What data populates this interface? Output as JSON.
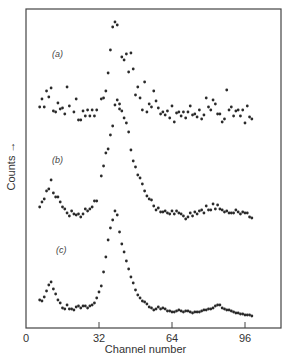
{
  "chart_data": {
    "type": "scatter",
    "title": "",
    "xlabel": "Channel number",
    "ylabel": "Counts →",
    "xlim": [
      0,
      110
    ],
    "xticks": [
      0,
      32,
      64,
      96
    ],
    "grid": false,
    "legend": null,
    "annotations": [
      "(a)",
      "(b)",
      "(c)"
    ],
    "y_units": "arbitrary (vertically offset spectra, y = screen px from top)",
    "series": [
      {
        "name": "(a)",
        "label_pos": [
          52,
          57
        ],
        "points": [
          [
            6,
            107
          ],
          [
            7,
            99
          ],
          [
            8,
            107
          ],
          [
            9,
            91
          ],
          [
            10,
            97
          ],
          [
            11,
            88
          ],
          [
            12,
            111
          ],
          [
            13,
            112
          ],
          [
            14,
            103
          ],
          [
            15,
            109
          ],
          [
            16,
            108
          ],
          [
            17,
            114
          ],
          [
            18,
            87
          ],
          [
            19,
            106
          ],
          [
            21,
            112
          ],
          [
            22,
            99
          ],
          [
            23,
            120
          ],
          [
            24,
            120
          ],
          [
            25,
            111
          ],
          [
            26,
            116
          ],
          [
            27,
            110
          ],
          [
            28,
            116
          ],
          [
            29,
            110
          ],
          [
            30,
            116
          ],
          [
            31,
            110
          ],
          [
            33,
            99
          ],
          [
            34,
            98
          ],
          [
            35,
            91
          ],
          [
            36,
            73
          ],
          [
            37,
            50
          ],
          [
            38,
            27
          ],
          [
            39,
            22
          ],
          [
            40,
            25
          ],
          [
            41,
            109
          ],
          [
            42,
            57
          ],
          [
            43,
            60
          ],
          [
            44,
            54
          ],
          [
            45,
            72
          ],
          [
            46,
            53
          ],
          [
            47,
            69
          ],
          [
            48,
            95
          ],
          [
            49,
            87
          ],
          [
            50,
            98
          ],
          [
            51,
            110
          ],
          [
            52,
            82
          ],
          [
            53,
            112
          ],
          [
            54,
            104
          ],
          [
            55,
            107
          ],
          [
            56,
            91
          ],
          [
            57,
            101
          ],
          [
            58,
            108
          ],
          [
            59,
            114
          ],
          [
            60,
            112
          ],
          [
            61,
            115
          ],
          [
            62,
            111
          ],
          [
            63,
            118
          ],
          [
            64,
            106
          ],
          [
            65,
            122
          ],
          [
            66,
            113
          ],
          [
            67,
            112
          ],
          [
            68,
            116
          ],
          [
            69,
            112
          ],
          [
            70,
            118
          ],
          [
            71,
            112
          ],
          [
            72,
            106
          ],
          [
            73,
            115
          ],
          [
            74,
            114
          ],
          [
            75,
            117
          ],
          [
            76,
            110
          ],
          [
            77,
            119
          ],
          [
            78,
            115
          ],
          [
            79,
            98
          ],
          [
            80,
            107
          ],
          [
            81,
            110
          ],
          [
            82,
            100
          ],
          [
            83,
            104
          ],
          [
            84,
            114
          ],
          [
            85,
            114
          ],
          [
            86,
            122
          ],
          [
            87,
            119
          ],
          [
            88,
            90
          ],
          [
            89,
            110
          ],
          [
            90,
            107
          ],
          [
            91,
            116
          ],
          [
            92,
            111
          ],
          [
            93,
            110
          ],
          [
            94,
            116
          ],
          [
            95,
            110
          ],
          [
            96,
            123
          ],
          [
            97,
            106
          ],
          [
            98,
            117
          ],
          [
            99,
            119
          ]
        ]
      },
      {
        "name": "(b)",
        "label_pos": [
          52,
          163
        ],
        "points": [
          [
            6,
            207
          ],
          [
            7,
            202
          ],
          [
            8,
            199
          ],
          [
            9,
            191
          ],
          [
            10,
            189
          ],
          [
            11,
            180
          ],
          [
            12,
            193
          ],
          [
            13,
            197
          ],
          [
            14,
            197
          ],
          [
            15,
            202
          ],
          [
            16,
            207
          ],
          [
            17,
            209
          ],
          [
            18,
            213
          ],
          [
            19,
            216
          ],
          [
            20,
            211
          ],
          [
            21,
            214
          ],
          [
            22,
            215
          ],
          [
            23,
            214
          ],
          [
            24,
            217
          ],
          [
            25,
            214
          ],
          [
            26,
            209
          ],
          [
            27,
            211
          ],
          [
            28,
            209
          ],
          [
            29,
            207
          ],
          [
            30,
            201
          ],
          [
            31,
            201
          ],
          [
            33,
            176
          ],
          [
            34,
            166
          ],
          [
            35,
            153
          ],
          [
            36,
            149
          ],
          [
            37,
            135
          ],
          [
            38,
            126
          ],
          [
            39,
            105
          ],
          [
            40,
            100
          ],
          [
            41,
            104
          ],
          [
            42,
            111
          ],
          [
            43,
            118
          ],
          [
            44,
            123
          ],
          [
            45,
            132
          ],
          [
            46,
            150
          ],
          [
            47,
            161
          ],
          [
            48,
            167
          ],
          [
            49,
            175
          ],
          [
            50,
            178
          ],
          [
            51,
            184
          ],
          [
            52,
            191
          ],
          [
            53,
            196
          ],
          [
            54,
            199
          ],
          [
            55,
            200
          ],
          [
            56,
            206
          ],
          [
            57,
            210
          ],
          [
            58,
            208
          ],
          [
            59,
            212
          ],
          [
            60,
            212
          ],
          [
            61,
            211
          ],
          [
            62,
            213
          ],
          [
            63,
            214
          ],
          [
            64,
            211
          ],
          [
            65,
            214
          ],
          [
            66,
            211
          ],
          [
            67,
            213
          ],
          [
            68,
            214
          ],
          [
            69,
            216
          ],
          [
            70,
            219
          ],
          [
            71,
            217
          ],
          [
            72,
            213
          ],
          [
            73,
            216
          ],
          [
            74,
            212
          ],
          [
            75,
            214
          ],
          [
            76,
            211
          ],
          [
            77,
            210
          ],
          [
            78,
            213
          ],
          [
            79,
            206
          ],
          [
            80,
            210
          ],
          [
            81,
            210
          ],
          [
            82,
            204
          ],
          [
            83,
            209
          ],
          [
            84,
            205
          ],
          [
            85,
            209
          ],
          [
            86,
            210
          ],
          [
            87,
            212
          ],
          [
            88,
            211
          ],
          [
            89,
            213
          ],
          [
            90,
            213
          ],
          [
            91,
            213
          ],
          [
            92,
            210
          ],
          [
            93,
            212
          ],
          [
            94,
            214
          ],
          [
            95,
            212
          ],
          [
            96,
            213
          ],
          [
            97,
            213
          ],
          [
            98,
            217
          ],
          [
            99,
            218
          ]
        ]
      },
      {
        "name": "(c)",
        "label_pos": [
          56,
          253
        ],
        "points": [
          [
            6,
            300
          ],
          [
            7,
            301
          ],
          [
            8,
            297
          ],
          [
            9,
            291
          ],
          [
            10,
            285
          ],
          [
            11,
            282
          ],
          [
            12,
            289
          ],
          [
            13,
            294
          ],
          [
            14,
            300
          ],
          [
            15,
            303
          ],
          [
            16,
            308
          ],
          [
            17,
            309
          ],
          [
            18,
            305
          ],
          [
            19,
            309
          ],
          [
            20,
            309
          ],
          [
            21,
            310
          ],
          [
            22,
            307
          ],
          [
            23,
            306
          ],
          [
            24,
            308
          ],
          [
            25,
            306
          ],
          [
            26,
            306
          ],
          [
            27,
            308
          ],
          [
            28,
            306
          ],
          [
            29,
            305
          ],
          [
            30,
            303
          ],
          [
            31,
            298
          ],
          [
            32,
            292
          ],
          [
            33,
            286
          ],
          [
            34,
            272
          ],
          [
            35,
            257
          ],
          [
            36,
            240
          ],
          [
            37,
            228
          ],
          [
            38,
            220
          ],
          [
            39,
            211
          ],
          [
            40,
            215
          ],
          [
            41,
            232
          ],
          [
            42,
            244
          ],
          [
            43,
            252
          ],
          [
            44,
            261
          ],
          [
            45,
            269
          ],
          [
            46,
            277
          ],
          [
            47,
            283
          ],
          [
            48,
            290
          ],
          [
            49,
            295
          ],
          [
            50,
            298
          ],
          [
            51,
            301
          ],
          [
            52,
            302
          ],
          [
            53,
            304
          ],
          [
            54,
            307
          ],
          [
            55,
            308
          ],
          [
            56,
            310
          ],
          [
            57,
            309
          ],
          [
            58,
            307
          ],
          [
            59,
            309
          ],
          [
            60,
            308
          ],
          [
            61,
            309
          ],
          [
            62,
            311
          ],
          [
            63,
            311
          ],
          [
            64,
            312
          ],
          [
            65,
            312
          ],
          [
            66,
            311
          ],
          [
            67,
            310
          ],
          [
            68,
            311
          ],
          [
            69,
            312
          ],
          [
            70,
            311
          ],
          [
            71,
            311
          ],
          [
            72,
            312
          ],
          [
            73,
            313
          ],
          [
            74,
            312
          ],
          [
            75,
            312
          ],
          [
            76,
            312
          ],
          [
            77,
            311
          ],
          [
            78,
            310
          ],
          [
            79,
            310
          ],
          [
            80,
            309
          ],
          [
            81,
            309
          ],
          [
            82,
            308
          ],
          [
            83,
            306
          ],
          [
            84,
            305
          ],
          [
            85,
            305
          ],
          [
            86,
            308
          ],
          [
            87,
            309
          ],
          [
            88,
            310
          ],
          [
            89,
            310
          ],
          [
            90,
            311
          ],
          [
            91,
            312
          ],
          [
            92,
            313
          ],
          [
            93,
            313
          ],
          [
            94,
            314
          ],
          [
            95,
            314
          ],
          [
            96,
            315
          ],
          [
            97,
            315
          ],
          [
            98,
            315
          ],
          [
            99,
            316
          ]
        ]
      }
    ]
  }
}
